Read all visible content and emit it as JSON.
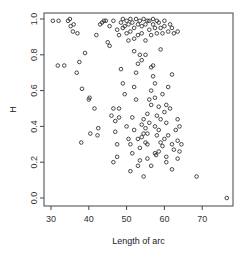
{
  "chart_data": {
    "type": "scatter",
    "title": "",
    "xlabel": "Length of arc",
    "ylabel": "H",
    "xlim": [
      28,
      78
    ],
    "ylim": [
      -0.03,
      1.05
    ],
    "xticks": [
      30,
      40,
      50,
      60,
      70
    ],
    "yticks": [
      0.0,
      0.2,
      0.4,
      0.6,
      0.8,
      1.0
    ],
    "xtick_labels": [
      "30",
      "40",
      "50",
      "60",
      "70"
    ],
    "ytick_labels": [
      "0.0",
      "0.2",
      "0.4",
      "0.6",
      "0.8",
      "1.0"
    ],
    "grid": false,
    "legend": null,
    "marker": "open-circle",
    "marker_color": "#333333",
    "points": [
      [
        30.5,
        0.99
      ],
      [
        31.8,
        0.74
      ],
      [
        32.0,
        0.99
      ],
      [
        33.5,
        0.74
      ],
      [
        34.5,
        0.99
      ],
      [
        35.0,
        1.0
      ],
      [
        35.2,
        0.96
      ],
      [
        36.0,
        0.97
      ],
      [
        35.8,
        0.93
      ],
      [
        37.0,
        0.92
      ],
      [
        36.8,
        0.7
      ],
      [
        37.5,
        0.76
      ],
      [
        38.2,
        0.61
      ],
      [
        38.0,
        0.31
      ],
      [
        39.0,
        0.81
      ],
      [
        40.4,
        0.36
      ],
      [
        40.0,
        0.55
      ],
      [
        40.2,
        0.56
      ],
      [
        41.5,
        0.5
      ],
      [
        42.3,
        0.35
      ],
      [
        42.5,
        0.39
      ],
      [
        42.0,
        0.91
      ],
      [
        43.0,
        0.97
      ],
      [
        43.5,
        0.98
      ],
      [
        44.0,
        0.99
      ],
      [
        45.0,
        0.87
      ],
      [
        45.5,
        0.85
      ],
      [
        46.0,
        0.46
      ],
      [
        46.5,
        0.5
      ],
      [
        47.0,
        0.37
      ],
      [
        47.5,
        0.3
      ],
      [
        47.0,
        0.43
      ],
      [
        48.0,
        0.5
      ],
      [
        48.5,
        0.98
      ],
      [
        49.0,
        0.95
      ],
      [
        49.0,
        1.0
      ],
      [
        49.5,
        0.96
      ],
      [
        50.0,
        0.92
      ],
      [
        50.0,
        0.99
      ],
      [
        50.5,
        0.97
      ],
      [
        51.0,
        1.0
      ],
      [
        51.0,
        0.93
      ],
      [
        51.5,
        0.98
      ],
      [
        52.0,
        0.89
      ],
      [
        52.0,
        0.95
      ],
      [
        52.5,
        1.0
      ],
      [
        53.0,
        0.97
      ],
      [
        53.0,
        0.91
      ],
      [
        53.5,
        0.99
      ],
      [
        54.0,
        0.96
      ],
      [
        54.0,
        0.92
      ],
      [
        54.5,
        1.0
      ],
      [
        55.0,
        0.97
      ],
      [
        55.0,
        0.88
      ],
      [
        55.5,
        0.99
      ],
      [
        56.0,
        0.94
      ],
      [
        56.0,
        0.99
      ],
      [
        56.5,
        0.91
      ],
      [
        57.0,
        0.97
      ],
      [
        57.0,
        1.0
      ],
      [
        57.5,
        0.95
      ],
      [
        58.0,
        0.92
      ],
      [
        58.0,
        0.99
      ],
      [
        58.5,
        0.98
      ],
      [
        59.0,
        0.95
      ],
      [
        59.5,
        0.92
      ],
      [
        60.0,
        0.96
      ],
      [
        60.0,
        0.99
      ],
      [
        61.0,
        0.93
      ],
      [
        61.5,
        0.97
      ],
      [
        62.0,
        0.95
      ],
      [
        62.5,
        0.92
      ],
      [
        63.5,
        0.93
      ],
      [
        48.5,
        0.72
      ],
      [
        49.0,
        0.64
      ],
      [
        49.5,
        0.58
      ],
      [
        50.0,
        0.4
      ],
      [
        50.5,
        0.33
      ],
      [
        51.0,
        0.3
      ],
      [
        51.5,
        0.25
      ],
      [
        51.0,
        0.15
      ],
      [
        51.5,
        0.45
      ],
      [
        52.0,
        0.38
      ],
      [
        52.5,
        0.55
      ],
      [
        52.0,
        0.62
      ],
      [
        52.5,
        0.7
      ],
      [
        53.0,
        0.75
      ],
      [
        53.5,
        0.8
      ],
      [
        53.0,
        0.33
      ],
      [
        53.5,
        0.28
      ],
      [
        53.5,
        0.21
      ],
      [
        54.0,
        0.34
      ],
      [
        54.5,
        0.36
      ],
      [
        54.0,
        0.41
      ],
      [
        54.5,
        0.44
      ],
      [
        55.0,
        0.39
      ],
      [
        55.0,
        0.31
      ],
      [
        55.5,
        0.3
      ],
      [
        55.5,
        0.36
      ],
      [
        56.0,
        0.42
      ],
      [
        56.0,
        0.55
      ],
      [
        56.5,
        0.52
      ],
      [
        56.5,
        0.73
      ],
      [
        57.0,
        0.74
      ],
      [
        57.0,
        0.68
      ],
      [
        57.5,
        0.4
      ],
      [
        57.5,
        0.64
      ],
      [
        58.0,
        0.46
      ],
      [
        58.0,
        0.35
      ],
      [
        58.5,
        0.38
      ],
      [
        59.0,
        0.44
      ],
      [
        59.0,
        0.31
      ],
      [
        59.5,
        0.29
      ],
      [
        60.0,
        0.33
      ],
      [
        60.0,
        0.48
      ],
      [
        60.5,
        0.42
      ],
      [
        60.5,
        0.23
      ],
      [
        61.0,
        0.35
      ],
      [
        61.5,
        0.5
      ],
      [
        61.0,
        0.62
      ],
      [
        62.0,
        0.3
      ],
      [
        62.5,
        0.27
      ],
      [
        62.0,
        0.16
      ],
      [
        63.0,
        0.38
      ],
      [
        63.5,
        0.22
      ],
      [
        63.5,
        0.32
      ],
      [
        64.0,
        0.4
      ],
      [
        64.0,
        0.26
      ],
      [
        62.0,
        0.69
      ],
      [
        57.5,
        0.25
      ],
      [
        57.8,
        0.24
      ],
      [
        53.0,
        0.18
      ],
      [
        54.5,
        0.12
      ],
      [
        48.0,
        0.45
      ],
      [
        47.5,
        0.23
      ],
      [
        46.5,
        0.2
      ],
      [
        58.5,
        0.26
      ],
      [
        60.5,
        0.2
      ],
      [
        55.5,
        0.22
      ],
      [
        56.5,
        0.18
      ],
      [
        68.5,
        0.12
      ],
      [
        76.5,
        0.0
      ],
      [
        44.5,
        0.99
      ],
      [
        45.5,
        0.96
      ],
      [
        47.5,
        0.94
      ],
      [
        48.0,
        0.91
      ],
      [
        46.5,
        0.99
      ],
      [
        50.5,
        0.88
      ],
      [
        59.0,
        0.83
      ],
      [
        55.0,
        0.8
      ],
      [
        52.0,
        0.82
      ],
      [
        54.0,
        0.77
      ],
      [
        56.5,
        0.6
      ],
      [
        57.5,
        0.56
      ],
      [
        59.5,
        0.58
      ],
      [
        60.5,
        0.52
      ],
      [
        55.5,
        0.47
      ],
      [
        58.5,
        0.51
      ],
      [
        63.5,
        0.44
      ],
      [
        64.5,
        0.3
      ]
    ]
  }
}
